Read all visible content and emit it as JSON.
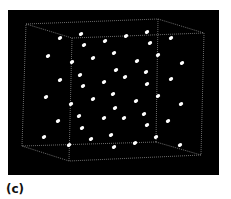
{
  "figure": {
    "panel_label": "(c)",
    "background_color": "#000000",
    "particle_color": "#ffffff",
    "edge_color": "#9a9a9a",
    "box": {
      "corners": {
        "back_top_left": [
          26,
          24
        ],
        "back_top_right": [
          158,
          19
        ],
        "front_top_left": [
          72,
          38
        ],
        "front_top_right": [
          204,
          33
        ],
        "back_bottom_left": [
          22,
          146
        ],
        "back_bottom_right": [
          156,
          142
        ],
        "front_bottom_left": [
          69,
          161
        ],
        "front_bottom_right": [
          201,
          155
        ]
      }
    },
    "particles": [
      [
        60,
        38
      ],
      [
        81,
        34
      ],
      [
        126,
        36
      ],
      [
        147,
        32
      ],
      [
        84,
        45
      ],
      [
        105,
        41
      ],
      [
        150,
        43
      ],
      [
        171,
        38
      ],
      [
        48,
        56
      ],
      [
        72,
        62
      ],
      [
        93,
        58
      ],
      [
        114,
        53
      ],
      [
        137,
        61
      ],
      [
        158,
        55
      ],
      [
        182,
        63
      ],
      [
        80,
        75
      ],
      [
        60,
        80
      ],
      [
        116,
        70
      ],
      [
        104,
        82
      ],
      [
        146,
        72
      ],
      [
        171,
        79
      ],
      [
        83,
        86
      ],
      [
        125,
        77
      ],
      [
        147,
        84
      ],
      [
        46,
        97
      ],
      [
        71,
        104
      ],
      [
        93,
        99
      ],
      [
        113,
        94
      ],
      [
        136,
        101
      ],
      [
        158,
        96
      ],
      [
        181,
        104
      ],
      [
        79,
        116
      ],
      [
        58,
        121
      ],
      [
        115,
        108
      ],
      [
        104,
        118
      ],
      [
        144,
        114
      ],
      [
        168,
        121
      ],
      [
        82,
        128
      ],
      [
        124,
        118
      ],
      [
        147,
        125
      ],
      [
        44,
        137
      ],
      [
        69,
        145
      ],
      [
        91,
        139
      ],
      [
        111,
        135
      ],
      [
        135,
        143
      ],
      [
        156,
        137
      ],
      [
        180,
        145
      ],
      [
        114,
        147
      ]
    ]
  }
}
